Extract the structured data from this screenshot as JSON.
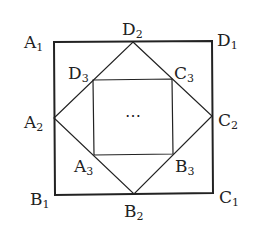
{
  "diagram": {
    "type": "nested squares",
    "colors": {
      "stroke": "#222222",
      "background": "#ffffff"
    },
    "outer_square": {
      "vertices": {
        "A1": [
          54,
          42
        ],
        "D1": [
          212,
          41
        ],
        "C1": [
          213,
          193
        ],
        "B1": [
          55,
          195
        ]
      }
    },
    "middle_square": {
      "vertices": {
        "D2": [
          133,
          42
        ],
        "C2": [
          212,
          116
        ],
        "B2": [
          134,
          194
        ],
        "A2": [
          54,
          118
        ]
      }
    },
    "inner_square": {
      "vertices": {
        "D3": [
          93,
          80
        ],
        "C3": [
          172,
          79
        ],
        "B3": [
          173,
          154
        ],
        "A3": [
          94,
          155
        ]
      }
    },
    "center_text": "⋯",
    "labels": [
      {
        "id": "A1",
        "main": "A",
        "sub": "1",
        "x": 24,
        "y": 48
      },
      {
        "id": "D1",
        "main": "D",
        "sub": "1",
        "x": 217,
        "y": 46
      },
      {
        "id": "D2",
        "main": "D",
        "sub": "2",
        "x": 122,
        "y": 35
      },
      {
        "id": "D3",
        "main": "D",
        "sub": "3",
        "x": 68,
        "y": 79
      },
      {
        "id": "C3",
        "main": "C",
        "sub": "3",
        "x": 174,
        "y": 79
      },
      {
        "id": "A2",
        "main": "A",
        "sub": "2",
        "x": 24,
        "y": 128
      },
      {
        "id": "C2",
        "main": "C",
        "sub": "2",
        "x": 218,
        "y": 126
      },
      {
        "id": "A3",
        "main": "A",
        "sub": "3",
        "x": 74,
        "y": 172
      },
      {
        "id": "B3",
        "main": "B",
        "sub": "3",
        "x": 175,
        "y": 172
      },
      {
        "id": "B1",
        "main": "B",
        "sub": "1",
        "x": 30,
        "y": 205
      },
      {
        "id": "C1",
        "main": "C",
        "sub": "1",
        "x": 219,
        "y": 203
      },
      {
        "id": "B2",
        "main": "B",
        "sub": "2",
        "x": 124,
        "y": 217
      }
    ]
  }
}
